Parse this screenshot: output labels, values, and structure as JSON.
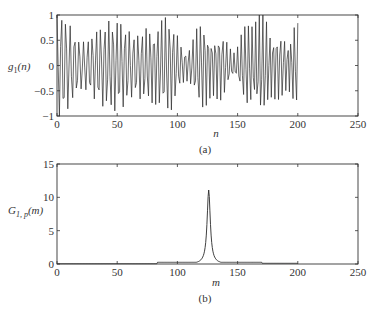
{
  "chart_data": [
    {
      "id": "a",
      "type": "line",
      "title": "",
      "caption": "(a)",
      "xlabel": "n",
      "ylabel": "g1(n)",
      "ylabel_main": "g",
      "ylabel_sub": "1",
      "ylabel_arg": "(n)",
      "xlim": [
        0,
        250
      ],
      "ylim": [
        -1,
        1
      ],
      "xticks": [
        0,
        50,
        100,
        150,
        200,
        250
      ],
      "yticks": [
        -1,
        -0.5,
        0,
        0.5,
        1
      ],
      "ytick_labels": [
        "−1",
        "−0.5",
        "0",
        "0.5",
        "1"
      ],
      "grid": false,
      "signal": {
        "description": "oscillatory chirp-like sequence, amplitude ~±1, defined for n = 0..200",
        "n_start": 0,
        "n_end": 200,
        "base_frequency": 0.27,
        "frequency_slope": 0.0002,
        "beat_frequency": 0.012,
        "amplitude_envelope": [
          {
            "n": 0,
            "amp": 0.95
          },
          {
            "n": 50,
            "amp": 0.85
          },
          {
            "n": 100,
            "amp": 0.8
          },
          {
            "n": 140,
            "amp": 0.6
          },
          {
            "n": 180,
            "amp": 1.0
          },
          {
            "n": 200,
            "amp": 0.7
          }
        ]
      }
    },
    {
      "id": "b",
      "type": "line",
      "title": "",
      "caption": "(b)",
      "xlabel": "m",
      "ylabel": "G1,p(m)",
      "ylabel_main": "G",
      "ylabel_sub": "1, p",
      "ylabel_arg": "(m)",
      "xlim": [
        0,
        250
      ],
      "ylim": [
        0,
        15
      ],
      "xticks": [
        0,
        50,
        100,
        150,
        200,
        250
      ],
      "yticks": [
        0,
        5,
        10,
        15
      ],
      "ytick_labels": [
        "0",
        "5",
        "10",
        "15"
      ],
      "grid": false,
      "peak": {
        "m": 126,
        "value": 11.1
      },
      "spectrum": {
        "description": "narrow peak at m≈126 with small baseline (~0.2) between m≈83 and m≈170, near zero elsewhere, defined for m = 0..200",
        "m_start": 0,
        "m_end": 200,
        "peak_width": 1.6,
        "baseline_ranges": [
          {
            "from": 0,
            "to": 83,
            "value": 0.05
          },
          {
            "from": 83,
            "to": 170,
            "value": 0.25
          },
          {
            "from": 170,
            "to": 200,
            "value": 0.1
          }
        ]
      }
    }
  ]
}
